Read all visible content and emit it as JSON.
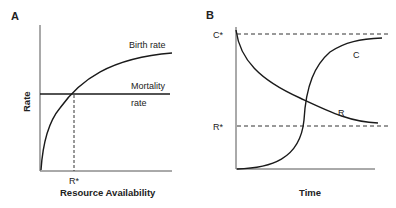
{
  "panel_a": {
    "label": "A",
    "y_axis_label": "Rate",
    "x_axis_label": "Resource Availability",
    "x_tick_label": "R*",
    "curve_labels": {
      "birth_rate": "Birth rate",
      "mortality_line1": "Mortality",
      "mortality_line2": "rate"
    }
  },
  "panel_b": {
    "label": "B",
    "x_axis_label": "Time",
    "y_tick_labels": {
      "c_star": "C*",
      "r_star": "R*"
    },
    "curve_labels": {
      "c": "C",
      "r": "R"
    }
  },
  "colors": {
    "line": "#1a1a1a",
    "axis": "#555555",
    "text": "#222222"
  }
}
